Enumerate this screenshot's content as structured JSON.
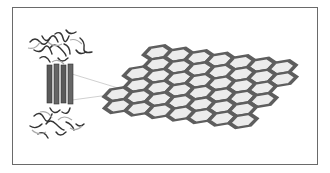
{
  "figure": {
    "left_panel": {
      "label": "protein-structure",
      "helix_count": 4
    },
    "right_panel": {
      "label": "hexagonal-lattice",
      "rows": 6,
      "cols": 7
    },
    "colors": {
      "frame": "#6a6a6a",
      "helix": "#555555",
      "lattice": "#6e6e6e",
      "lattice_edge": "#4a4a4a",
      "background": "#ffffff"
    }
  }
}
